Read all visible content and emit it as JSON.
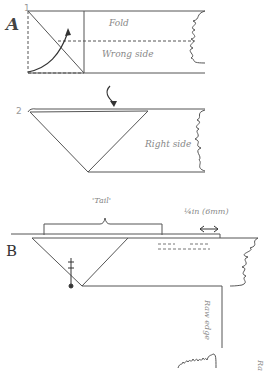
{
  "diagram": {
    "sections": [
      {
        "id": "A",
        "label": "A",
        "steps": [
          {
            "number": "1",
            "labels": {
              "fold": "Fold",
              "wrong_side": "Wrong side"
            }
          },
          {
            "number": "2",
            "labels": {
              "right_side": "Right side"
            }
          }
        ]
      },
      {
        "id": "B",
        "label": "B",
        "labels": {
          "tail": "'Tail'",
          "measurement": "¼in (6mm)",
          "raw_edge": "Raw edge",
          "raw_edge_partial": "Ra"
        }
      }
    ],
    "colors": {
      "line": "#555555",
      "text": "#888888",
      "dashed": "#777777"
    }
  }
}
